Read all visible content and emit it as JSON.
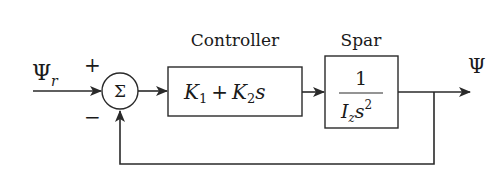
{
  "diagram": {
    "type": "control-block-diagram",
    "input": {
      "label": "Ψ",
      "subscript": "r"
    },
    "summing_junction": {
      "symbol": "Σ",
      "plus_sign": "+",
      "minus_sign": "−"
    },
    "controller": {
      "title": "Controller",
      "tf": {
        "k1": "K",
        "k1_sub": "1",
        "plus": "+",
        "k2": "K",
        "k2_sub": "2",
        "s": "s"
      }
    },
    "plant": {
      "title": "Spar",
      "tf": {
        "numerator": "1",
        "den_i": "I",
        "den_i_sub": "z",
        "den_s": "s",
        "den_exp": "2"
      }
    },
    "output": {
      "label": "Ψ"
    },
    "feedback": {
      "type": "unity",
      "sign": "negative"
    },
    "colors": {
      "line": "#2a2a2a",
      "text": "#1a1a1a",
      "background": "#ffffff"
    }
  }
}
